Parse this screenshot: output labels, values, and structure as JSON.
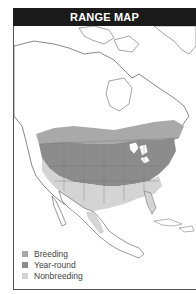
{
  "header": {
    "title": "RANGE MAP"
  },
  "legend": {
    "items": [
      {
        "label": "Breeding",
        "color": "#a9a9a9"
      },
      {
        "label": "Year-round",
        "color": "#8c8c8c"
      },
      {
        "label": "Nonbreeding",
        "color": "#d4d4d4"
      }
    ]
  },
  "colors": {
    "land": "#ffffff",
    "breeding": "#a9a9a9",
    "year_round": "#8c8c8c",
    "nonbreeding": "#d4d4d4",
    "border": "#555555",
    "header_bg": "#1a1a1a"
  }
}
